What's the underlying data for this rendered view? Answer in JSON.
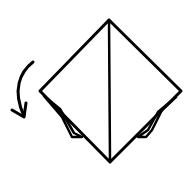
{
  "diagram": {
    "type": "origami-fold-step",
    "background": "#ffffff",
    "stroke": "#000000",
    "shape": "diamond-with-center-crease",
    "arrow": "curved-fold-arrow-down-left",
    "flaps": [
      "left-lower-flap",
      "right-lower-flap"
    ]
  }
}
